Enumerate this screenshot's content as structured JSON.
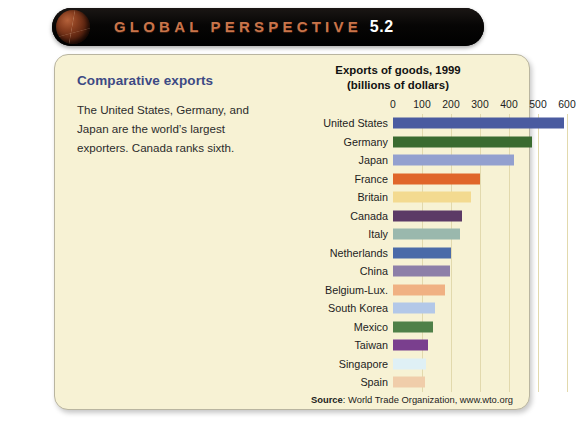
{
  "banner": {
    "icon": "globe-icon",
    "title_word": "GLOBAL PERSPECTIVE",
    "number": "5.2"
  },
  "callout": {
    "heading": "Comparative exports",
    "body": "The United States, Germany, and Japan are the world’s largest exporters. Canada ranks sixth."
  },
  "source": {
    "label": "Source",
    "text": ": World Trade Organization, www.wto.org"
  },
  "chart_data": {
    "type": "bar",
    "orientation": "horizontal",
    "title": "Exports of goods, 1999",
    "subtitle": "(billions of dollars)",
    "xlabel": "",
    "ylabel": "",
    "xlim": [
      0,
      600
    ],
    "ticks": [
      "0",
      "100",
      "200",
      "300",
      "400",
      "500",
      "600"
    ],
    "grid": true,
    "legend": "none",
    "categories": [
      "United States",
      "Germany",
      "Japan",
      "France",
      "Britain",
      "Canada",
      "Italy",
      "Netherlands",
      "China",
      "Belgium-Lux.",
      "South Korea",
      "Mexico",
      "Taiwan",
      "Singapore",
      "Spain"
    ],
    "values": [
      588,
      478,
      417,
      300,
      268,
      238,
      230,
      200,
      195,
      180,
      145,
      137,
      122,
      115,
      110
    ],
    "colors": [
      "#4a5ba0",
      "#3a6b30",
      "#93a0cf",
      "#e0662a",
      "#f3da90",
      "#5c3a66",
      "#9ab8ad",
      "#4a6aa8",
      "#8d7fa8",
      "#f0b183",
      "#b3c8e8",
      "#4f8048",
      "#7a3f8e",
      "#dff0f5",
      "#f0cdaa"
    ]
  }
}
